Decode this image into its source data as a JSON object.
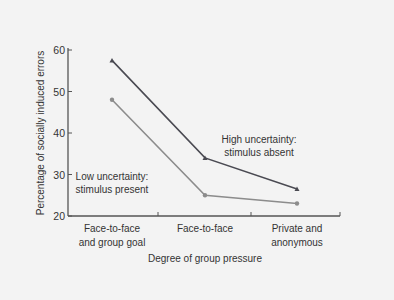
{
  "chart_data": {
    "type": "line",
    "title": "",
    "xlabel": "Degree of group pressure",
    "ylabel": "Percentage of socially induced errors",
    "categories": [
      [
        "Face-to-face",
        "and group goal"
      ],
      [
        "Face-to-face"
      ],
      [
        "Private and",
        "anonymous"
      ]
    ],
    "ylim": [
      20,
      60
    ],
    "yticks": [
      20,
      30,
      40,
      50,
      60
    ],
    "grid": false,
    "series": [
      {
        "name": "High uncertainty: stimulus absent",
        "label_lines": [
          "High uncertainty:",
          "stimulus absent"
        ],
        "values": [
          57.5,
          34,
          26.5
        ],
        "color": "#4a4a52",
        "marker": "triangle"
      },
      {
        "name": "Low uncertainty: stimulus present",
        "label_lines": [
          "Low uncertainty:",
          "stimulus present"
        ],
        "values": [
          48,
          25,
          23
        ],
        "color": "#8c8c8c",
        "marker": "circle"
      }
    ]
  },
  "colors": {
    "background": "#f3f3f3",
    "axis": "#555555",
    "text": "#333333"
  }
}
